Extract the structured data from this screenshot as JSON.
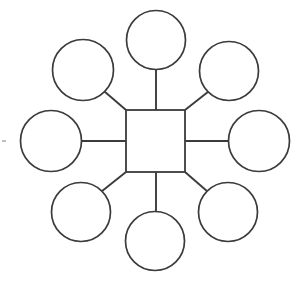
{
  "diagram": {
    "type": "hub-and-spoke",
    "canvas": {
      "width": 305,
      "height": 283,
      "background": "#ffffff"
    },
    "stroke_color": "#3b3b3b",
    "fill_color": "#ffffff",
    "hub": {
      "name": "center-topic",
      "shape": "square",
      "label": "",
      "x": 126,
      "y": 110,
      "width": 59,
      "height": 62,
      "center_x": 155.5,
      "center_y": 141
    },
    "spoke_count": 8,
    "nodes": [
      {
        "name": "node-top",
        "position": "top",
        "label": "",
        "center_x": 156,
        "center_y": 40,
        "radius": 29.5,
        "connector": {
          "x1": 156,
          "y1": 69.5,
          "x2": 156,
          "y2": 110
        }
      },
      {
        "name": "node-top-right",
        "position": "top-right",
        "label": "",
        "center_x": 229,
        "center_y": 71,
        "radius": 29.5,
        "connector": {
          "x1": 208.2,
          "y1": 91.8,
          "x2": 185,
          "y2": 110
        }
      },
      {
        "name": "node-right",
        "position": "right",
        "label": "",
        "center_x": 259,
        "center_y": 141,
        "radius": 30.5,
        "connector": {
          "x1": 228.5,
          "y1": 141,
          "x2": 185,
          "y2": 141
        }
      },
      {
        "name": "node-bottom-right",
        "position": "bottom-right",
        "label": "",
        "center_x": 228,
        "center_y": 212,
        "radius": 29.5,
        "connector": {
          "x1": 207.2,
          "y1": 191.2,
          "x2": 185,
          "y2": 172
        }
      },
      {
        "name": "node-bottom",
        "position": "bottom",
        "label": "",
        "center_x": 155,
        "center_y": 241,
        "radius": 29.5,
        "connector": {
          "x1": 156,
          "y1": 211.5,
          "x2": 156,
          "y2": 172
        }
      },
      {
        "name": "node-bottom-left",
        "position": "bottom-left",
        "label": "",
        "center_x": 81,
        "center_y": 212,
        "radius": 29.5,
        "connector": {
          "x1": 101.8,
          "y1": 191.2,
          "x2": 126,
          "y2": 172
        }
      },
      {
        "name": "node-left",
        "position": "left",
        "label": "",
        "center_x": 51,
        "center_y": 141,
        "radius": 30.5,
        "connector": {
          "x1": 81.5,
          "y1": 141,
          "x2": 126,
          "y2": 141
        }
      },
      {
        "name": "node-top-left",
        "position": "top-left",
        "label": "",
        "center_x": 83,
        "center_y": 70,
        "radius": 30.5,
        "connector": {
          "x1": 104.5,
          "y1": 91.5,
          "x2": 126,
          "y2": 110
        }
      }
    ],
    "artifacts": [
      {
        "name": "scan-speck",
        "x": 2,
        "y": 141,
        "width": 4,
        "height": 2
      }
    ]
  }
}
